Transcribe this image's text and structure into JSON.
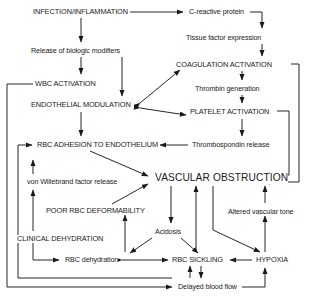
{
  "diagram": {
    "type": "flowchart",
    "background_color": "#ffffff",
    "line_color": "#1a1a1a",
    "text_color": "#1a1a1a",
    "nodes": [
      {
        "id": "infection",
        "label": "INFECTION/INFLAMMATION",
        "style": "caps",
        "x": 33,
        "y": 8
      },
      {
        "id": "crp",
        "label": "C-reactive protein",
        "style": "lower",
        "x": 189,
        "y": 8
      },
      {
        "id": "tissue_factor",
        "label": "Tissue factor expression",
        "style": "lower",
        "x": 186,
        "y": 34
      },
      {
        "id": "biologic",
        "label": "Release of biologic modifiers",
        "style": "lower",
        "x": 31,
        "y": 47
      },
      {
        "id": "coagulation",
        "label": "COAGULATION ACTIVATION",
        "style": "caps",
        "x": 176,
        "y": 61
      },
      {
        "id": "wbc",
        "label": "WBC ACTIVATION",
        "style": "caps",
        "x": 35,
        "y": 80
      },
      {
        "id": "thrombin",
        "label": "Thrombin generation",
        "style": "lower",
        "x": 195,
        "y": 85
      },
      {
        "id": "endothelial",
        "label": "ENDOTHELIAL MODULATION",
        "style": "caps",
        "x": 31,
        "y": 101
      },
      {
        "id": "platelet",
        "label": "PLATELET ACTIVATION",
        "style": "caps",
        "x": 190,
        "y": 108
      },
      {
        "id": "rbc_adhesion",
        "label": "RBC ADHESION TO ENDOTHELIUM",
        "style": "caps",
        "x": 37,
        "y": 141
      },
      {
        "id": "thrombospondin",
        "label": "Thrombospondin release",
        "style": "lower",
        "x": 192,
        "y": 141
      },
      {
        "id": "vwf",
        "label": "von Willebrand factor release",
        "style": "lower",
        "x": 27,
        "y": 178
      },
      {
        "id": "vascular_obs",
        "label": "VASCULAR OBSTRUCTION",
        "style": "big",
        "x": 155,
        "y": 173
      },
      {
        "id": "poor_deform",
        "label": "POOR RBC DEFORMABILITY",
        "style": "caps",
        "x": 46,
        "y": 207
      },
      {
        "id": "altered_tone",
        "label": "Altered vascular tone",
        "style": "lower",
        "x": 228,
        "y": 208
      },
      {
        "id": "acidosis",
        "label": "Acidosis",
        "style": "lower",
        "x": 155,
        "y": 228
      },
      {
        "id": "clinical_dehy",
        "label": "CLINICAL DEHYDRATION",
        "style": "caps",
        "x": 17,
        "y": 235
      },
      {
        "id": "rbc_dehy",
        "label": "RBC dehydration",
        "style": "lower",
        "x": 65,
        "y": 256
      },
      {
        "id": "rbc_sickling",
        "label": "RBC SICKLING",
        "style": "caps",
        "x": 172,
        "y": 256
      },
      {
        "id": "hypoxia",
        "label": "HYPOXIA",
        "style": "caps",
        "x": 256,
        "y": 256
      },
      {
        "id": "delayed_flow",
        "label": "Delayed blood flow",
        "style": "lower",
        "x": 178,
        "y": 283
      }
    ],
    "edges": [
      {
        "from": "infection",
        "to": "crp",
        "arrow": "single"
      },
      {
        "from": "crp",
        "to": "tissue_factor",
        "arrow": "single"
      },
      {
        "from": "infection",
        "to": "biologic",
        "arrow": "single"
      },
      {
        "from": "tissue_factor",
        "to": "coagulation",
        "arrow": "single"
      },
      {
        "from": "biologic",
        "to": "wbc",
        "arrow": "single"
      },
      {
        "from": "biologic",
        "to": "endothelial",
        "arrow": "single"
      },
      {
        "from": "coagulation",
        "to": "thrombin",
        "arrow": "single"
      },
      {
        "from": "thrombin",
        "to": "platelet",
        "arrow": "single"
      },
      {
        "from": "endothelial",
        "to": "coagulation",
        "arrow": "double"
      },
      {
        "from": "endothelial",
        "to": "platelet",
        "arrow": "double"
      },
      {
        "from": "wbc",
        "to": "delayed_flow",
        "arrow": "single"
      },
      {
        "from": "endothelial",
        "to": "rbc_adhesion",
        "arrow": "single"
      },
      {
        "from": "platelet",
        "to": "thrombospondin",
        "arrow": "single"
      },
      {
        "from": "thrombospondin",
        "to": "rbc_adhesion",
        "arrow": "single"
      },
      {
        "from": "rbc_adhesion",
        "to": "vascular_obs",
        "arrow": "single"
      },
      {
        "from": "vwf",
        "to": "rbc_adhesion",
        "arrow": "single"
      },
      {
        "from": "clinical_dehy",
        "to": "vwf",
        "arrow": "single"
      },
      {
        "from": "poor_deform",
        "to": "vascular_obs",
        "arrow": "single"
      },
      {
        "from": "clinical_dehy",
        "to": "rbc_dehy",
        "arrow": "single"
      },
      {
        "from": "rbc_dehy",
        "to": "poor_deform",
        "arrow": "single"
      },
      {
        "from": "vascular_obs",
        "to": "acidosis",
        "arrow": "single"
      },
      {
        "from": "acidosis",
        "to": "rbc_dehy",
        "arrow": "single"
      },
      {
        "from": "acidosis",
        "to": "rbc_sickling",
        "arrow": "single"
      },
      {
        "from": "rbc_dehy",
        "to": "rbc_sickling",
        "arrow": "double"
      },
      {
        "from": "rbc_sickling",
        "to": "vascular_obs",
        "arrow": "single"
      },
      {
        "from": "vascular_obs",
        "to": "hypoxia",
        "arrow": "single"
      },
      {
        "from": "hypoxia",
        "to": "rbc_sickling",
        "arrow": "single"
      },
      {
        "from": "hypoxia",
        "to": "altered_tone",
        "arrow": "single"
      },
      {
        "from": "altered_tone",
        "to": "vascular_obs",
        "arrow": "single"
      },
      {
        "from": "rbc_sickling",
        "to": "delayed_flow",
        "arrow": "double"
      },
      {
        "from": "delayed_flow",
        "to": "hypoxia",
        "arrow": "single"
      },
      {
        "from": "coagulation",
        "to": "vascular_obs",
        "arrow": "single"
      },
      {
        "from": "platelet",
        "to": "vascular_obs",
        "arrow": "single"
      },
      {
        "from": "delayed_flow",
        "to": "rbc_adhesion",
        "arrow": "single"
      }
    ]
  }
}
